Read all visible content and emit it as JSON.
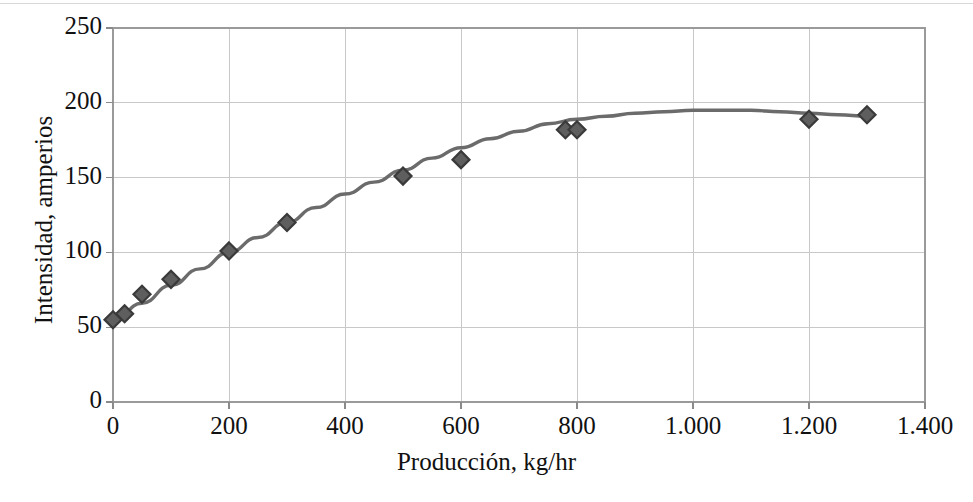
{
  "chart_data": {
    "type": "scatter",
    "title": "",
    "subtitle": "",
    "xlabel": "Producción, kg/hr",
    "ylabel": "Intensidad, amperios",
    "xlim": [
      0,
      1400
    ],
    "ylim": [
      0,
      250
    ],
    "xticks": [
      0,
      200,
      400,
      600,
      800,
      1000,
      1200,
      1400
    ],
    "yticks": [
      0,
      50,
      100,
      150,
      200,
      250
    ],
    "xtick_labels": [
      "0",
      "200",
      "400",
      "600",
      "800",
      "1.000",
      "1.200",
      "1.400"
    ],
    "ytick_labels": [
      "0",
      "50",
      "100",
      "150",
      "200",
      "250"
    ],
    "grid": true,
    "legend": "none",
    "marker": "diamond",
    "marker_color": "#5e5e5e",
    "marker_edge_color": "#3a3a3a",
    "line_color": "#6b6b6b",
    "grid_color": "#c8c8c8",
    "frame_color": "#9a9a9a",
    "series": [
      {
        "name": "Datos",
        "type": "scatter",
        "x": [
          0,
          20,
          50,
          100,
          200,
          300,
          500,
          600,
          780,
          800,
          1200,
          1300
        ],
        "y": [
          55,
          59,
          72,
          82,
          101,
          120,
          151,
          162,
          182,
          182,
          189,
          192
        ]
      },
      {
        "name": "Ajuste",
        "type": "line",
        "x": [
          0,
          50,
          100,
          150,
          200,
          250,
          300,
          350,
          400,
          450,
          500,
          550,
          600,
          650,
          700,
          750,
          800,
          850,
          900,
          950,
          1000,
          1050,
          1100,
          1150,
          1200,
          1250,
          1300
        ],
        "y": [
          54,
          66,
          78,
          89,
          100,
          110,
          120,
          130,
          139,
          147,
          155,
          163,
          170,
          176,
          181,
          186,
          189,
          191,
          193,
          194,
          195,
          195,
          195,
          194,
          193,
          192,
          191
        ]
      }
    ]
  },
  "axes": {
    "ylabel_text": "Intensidad, amperios",
    "xlabel_text": "Producción, kg/hr"
  }
}
